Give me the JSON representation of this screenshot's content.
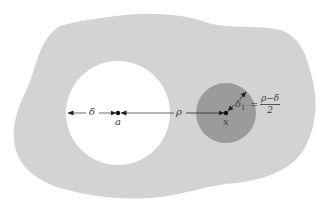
{
  "diagram": {
    "type": "geometric-illustration",
    "colors": {
      "background": "#ffffff",
      "region_fill": "#d3d3d3",
      "hole_fill": "#ffffff",
      "ball_fill": "#9b9b9b",
      "line": "#333333"
    },
    "region": {
      "label": "domain region (irregular blob)"
    },
    "hole": {
      "label": "excluded disk around a",
      "center": [
        118,
        113
      ],
      "radius": 52
    },
    "ball": {
      "label": "ball around x",
      "center": [
        226,
        113
      ],
      "radius": 30
    },
    "points": {
      "a": {
        "label": "a"
      },
      "x": {
        "label": "x"
      }
    },
    "distances": {
      "delta": {
        "label": "δ"
      },
      "rho": {
        "label": "ρ"
      },
      "delta1": {
        "label": "δ",
        "subscript": "1"
      }
    },
    "equation": {
      "equals": "=",
      "numerator": "ρ−δ",
      "denominator": "2"
    }
  }
}
